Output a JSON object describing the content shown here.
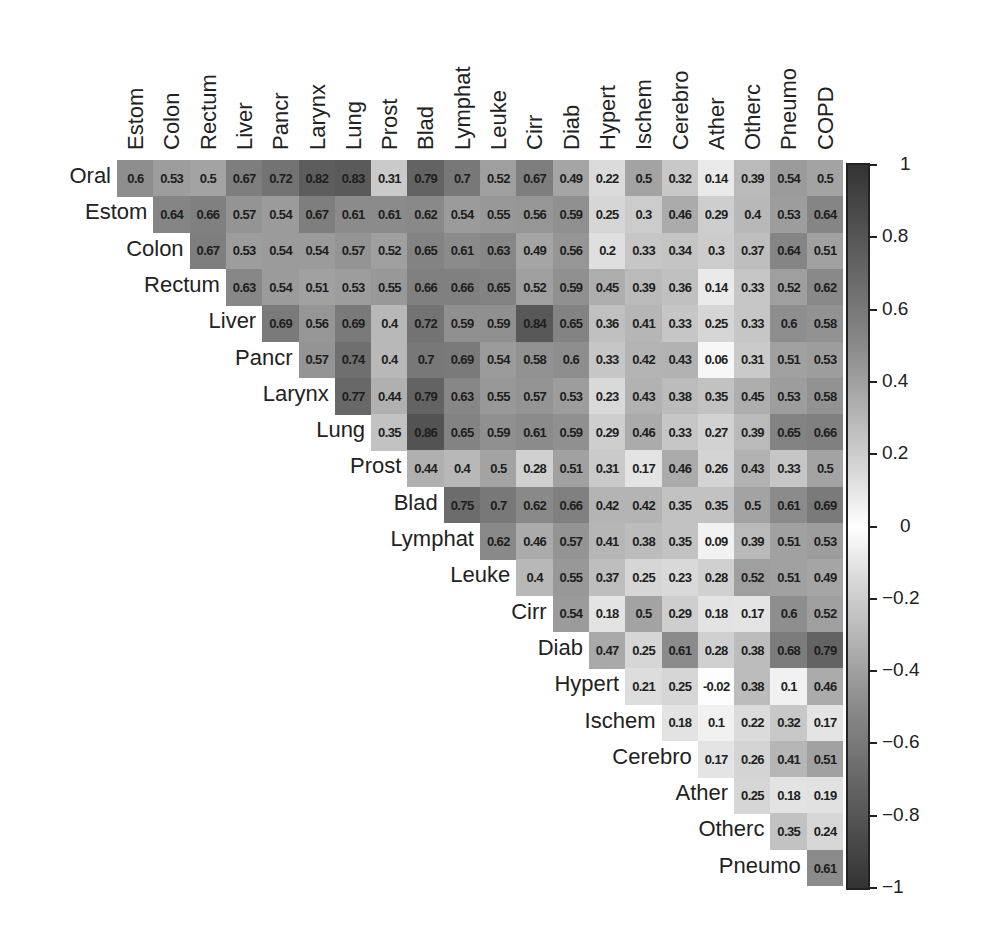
{
  "chart_data": {
    "type": "heatmap",
    "title": "",
    "subtitle": "",
    "xlabel": "",
    "ylabel": "",
    "layout": "upper-triangular correlation matrix, row labels on left of diagonal, column labels rotated on top",
    "row_labels": [
      "Oral",
      "Estom",
      "Colon",
      "Rectum",
      "Liver",
      "Pancr",
      "Larynx",
      "Lung",
      "Prost",
      "Blad",
      "Lymphat",
      "Leuke",
      "Cirr",
      "Diab",
      "Hypert",
      "Ischem",
      "Cerebro",
      "Ather",
      "Otherc",
      "Pneumo"
    ],
    "column_labels": [
      "Estom",
      "Colon",
      "Rectum",
      "Liver",
      "Pancr",
      "Larynx",
      "Lung",
      "Prost",
      "Blad",
      "Lymphat",
      "Leuke",
      "Cirr",
      "Diab",
      "Hypert",
      "Ischem",
      "Cerebro",
      "Ather",
      "Otherc",
      "Pneumo",
      "COPD"
    ],
    "rows": [
      {
        "label": "Oral",
        "values": [
          "0.6",
          "0.53",
          "0.5",
          "0.67",
          "0.72",
          "0.82",
          "0.83",
          "0.31",
          "0.79",
          "0.7",
          "0.52",
          "0.67",
          "0.49",
          "0.22",
          "0.5",
          "0.32",
          "0.14",
          "0.39",
          "0.54",
          "0.5"
        ]
      },
      {
        "label": "Estom",
        "values": [
          "0.64",
          "0.66",
          "0.57",
          "0.54",
          "0.67",
          "0.61",
          "0.61",
          "0.62",
          "0.54",
          "0.55",
          "0.56",
          "0.59",
          "0.25",
          "0.3",
          "0.46",
          "0.29",
          "0.4",
          "0.53",
          "0.64"
        ]
      },
      {
        "label": "Colon",
        "values": [
          "0.67",
          "0.53",
          "0.54",
          "0.54",
          "0.57",
          "0.52",
          "0.65",
          "0.61",
          "0.63",
          "0.49",
          "0.56",
          "0.2",
          "0.33",
          "0.34",
          "0.3",
          "0.37",
          "0.64",
          "0.51"
        ]
      },
      {
        "label": "Rectum",
        "values": [
          "0.63",
          "0.54",
          "0.51",
          "0.53",
          "0.55",
          "0.66",
          "0.66",
          "0.65",
          "0.52",
          "0.59",
          "0.45",
          "0.39",
          "0.36",
          "0.14",
          "0.33",
          "0.52",
          "0.62"
        ]
      },
      {
        "label": "Liver",
        "values": [
          "0.69",
          "0.56",
          "0.69",
          "0.4",
          "0.72",
          "0.59",
          "0.59",
          "0.84",
          "0.65",
          "0.36",
          "0.41",
          "0.33",
          "0.25",
          "0.33",
          "0.6",
          "0.58"
        ]
      },
      {
        "label": "Pancr",
        "values": [
          "0.57",
          "0.74",
          "0.4",
          "0.7",
          "0.69",
          "0.54",
          "0.58",
          "0.6",
          "0.33",
          "0.42",
          "0.43",
          "0.06",
          "0.31",
          "0.51",
          "0.53"
        ]
      },
      {
        "label": "Larynx",
        "values": [
          "0.77",
          "0.44",
          "0.79",
          "0.63",
          "0.55",
          "0.57",
          "0.53",
          "0.23",
          "0.43",
          "0.38",
          "0.35",
          "0.45",
          "0.53",
          "0.58"
        ]
      },
      {
        "label": "Lung",
        "values": [
          "0.35",
          "0.86",
          "0.65",
          "0.59",
          "0.61",
          "0.59",
          "0.29",
          "0.46",
          "0.33",
          "0.27",
          "0.39",
          "0.65",
          "0.66"
        ]
      },
      {
        "label": "Prost",
        "values": [
          "0.44",
          "0.4",
          "0.5",
          "0.28",
          "0.51",
          "0.31",
          "0.17",
          "0.46",
          "0.26",
          "0.43",
          "0.33",
          "0.5"
        ]
      },
      {
        "label": "Blad",
        "values": [
          "0.75",
          "0.7",
          "0.62",
          "0.66",
          "0.42",
          "0.42",
          "0.35",
          "0.35",
          "0.5",
          "0.61",
          "0.69"
        ]
      },
      {
        "label": "Lymphat",
        "values": [
          "0.62",
          "0.46",
          "0.57",
          "0.41",
          "0.38",
          "0.35",
          "0.09",
          "0.39",
          "0.51",
          "0.53"
        ]
      },
      {
        "label": "Leuke",
        "values": [
          "0.4",
          "0.55",
          "0.37",
          "0.25",
          "0.23",
          "0.28",
          "0.52",
          "0.51",
          "0.49"
        ]
      },
      {
        "label": "Cirr",
        "values": [
          "0.54",
          "0.18",
          "0.5",
          "0.29",
          "0.18",
          "0.17",
          "0.6",
          "0.52"
        ]
      },
      {
        "label": "Diab",
        "values": [
          "0.47",
          "0.25",
          "0.61",
          "0.28",
          "0.38",
          "0.68",
          "0.79"
        ]
      },
      {
        "label": "Hypert",
        "values": [
          "0.21",
          "0.25",
          "-0.02",
          "0.38",
          "0.1",
          "0.46"
        ]
      },
      {
        "label": "Ischem",
        "values": [
          "0.18",
          "0.1",
          "0.22",
          "0.32",
          "0.17"
        ]
      },
      {
        "label": "Cerebro",
        "values": [
          "0.17",
          "0.26",
          "0.41",
          "0.51"
        ]
      },
      {
        "label": "Ather",
        "values": [
          "0.25",
          "0.18",
          "0.19"
        ]
      },
      {
        "label": "Otherc",
        "values": [
          "0.35",
          "0.24"
        ]
      },
      {
        "label": "Pneumo",
        "values": [
          "0.61"
        ]
      }
    ],
    "colorbar": {
      "range": [
        -1,
        1
      ],
      "ticks": [
        "1",
        "0.8",
        "0.6",
        "0.4",
        "0.2",
        "0",
        "−0.2",
        "−0.4",
        "−0.6",
        "−0.8",
        "−1"
      ],
      "tick_values": [
        1,
        0.8,
        0.6,
        0.4,
        0.2,
        0,
        -0.2,
        -0.4,
        -0.6,
        -0.8,
        -1
      ],
      "colormap": "grayscale, white at 0, dark gray at ±1",
      "color_zero": "#ffffff",
      "color_extreme": "#333333"
    },
    "grid": false,
    "legend_position": "right"
  }
}
